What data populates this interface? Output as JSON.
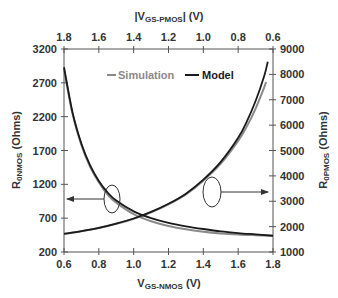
{
  "chart_data": {
    "type": "line",
    "title": "",
    "xlabel": "V_GS-NMOS (V)",
    "xlabel_main": "V",
    "xlabel_sub": "GS-NMOS",
    "xlabel_unit": " (V)",
    "x2label_main": "|V",
    "x2label_sub": "GS-PMOS",
    "x2label_unit": "| (V)",
    "ylabel_main": "R",
    "ylabel_sub": "0NMOS",
    "ylabel_unit": " (Ohms)",
    "y2label_main": "R",
    "y2label_sub": "0PMOS",
    "y2label_unit": " (Ohms)",
    "xlim": [
      0.6,
      1.8
    ],
    "x2lim": [
      1.8,
      0.6
    ],
    "ylim": [
      200,
      3200
    ],
    "y2lim": [
      1000,
      9000
    ],
    "x_ticks": [
      "0.6",
      "0.8",
      "1.0",
      "1.2",
      "1.4",
      "1.6",
      "1.8"
    ],
    "x2_ticks": [
      "1.8",
      "1.6",
      "1.4",
      "1.2",
      "1.0",
      "0.8",
      "0.6"
    ],
    "y_ticks": [
      "3200",
      "2700",
      "2200",
      "1700",
      "1200",
      "700",
      "200"
    ],
    "y2_ticks": [
      "9000",
      "8000",
      "7000",
      "6000",
      "5000",
      "4000",
      "3000",
      "2000",
      "1000"
    ],
    "grid": false,
    "legend": {
      "position": "top-center",
      "entries": [
        {
          "name": "Simulation",
          "color": "#8a8a8a"
        },
        {
          "name": "Model",
          "color": "#1a1a1a"
        }
      ]
    },
    "series": [
      {
        "name": "Model R0NMOS (left axis)",
        "axis": "left",
        "color": "#1a1a1a",
        "x": [
          0.6,
          0.65,
          0.7,
          0.75,
          0.8,
          0.85,
          0.9,
          1.0,
          1.1,
          1.2,
          1.3,
          1.4,
          1.5,
          1.6,
          1.7,
          1.8
        ],
        "values": [
          2930,
          2250,
          1800,
          1480,
          1250,
          1080,
          960,
          800,
          700,
          630,
          580,
          540,
          505,
          480,
          460,
          440
        ]
      },
      {
        "name": "Simulation R0NMOS (left axis)",
        "axis": "left",
        "color": "#8a8a8a",
        "x": [
          0.6,
          0.65,
          0.7,
          0.75,
          0.8,
          0.85,
          0.9,
          1.0,
          1.1,
          1.2,
          1.3,
          1.4,
          1.5,
          1.6,
          1.7,
          1.8
        ],
        "values": [
          2900,
          2230,
          1780,
          1460,
          1230,
          1050,
          930,
          760,
          655,
          585,
          535,
          500,
          475,
          458,
          448,
          440
        ]
      },
      {
        "name": "Model R0PMOS (right axis)",
        "axis": "right",
        "color": "#1a1a1a",
        "x": [
          0.6,
          0.7,
          0.8,
          0.9,
          1.0,
          1.1,
          1.2,
          1.3,
          1.4,
          1.5,
          1.6,
          1.65,
          1.7,
          1.75,
          1.77
        ],
        "values": [
          1710,
          1820,
          1950,
          2120,
          2320,
          2580,
          2900,
          3300,
          3850,
          4550,
          5500,
          6150,
          6950,
          7950,
          8500
        ]
      },
      {
        "name": "Simulation R0PMOS (right axis)",
        "axis": "right",
        "color": "#8a8a8a",
        "x": [
          0.6,
          0.7,
          0.8,
          0.9,
          1.0,
          1.1,
          1.2,
          1.3,
          1.4,
          1.5,
          1.6,
          1.65,
          1.7,
          1.75,
          1.76
        ],
        "values": [
          1710,
          1815,
          1945,
          2110,
          2310,
          2565,
          2880,
          3270,
          3810,
          4480,
          5380,
          5950,
          6650,
          7500,
          7700
        ]
      }
    ],
    "annotations": [
      {
        "type": "ellipse-arrow",
        "points_to": "left axis",
        "cx_v": 0.88,
        "cy_r": 1000
      },
      {
        "type": "ellipse-arrow",
        "points_to": "right axis",
        "cx_v": 1.47,
        "cy_r2": 3300
      }
    ]
  }
}
